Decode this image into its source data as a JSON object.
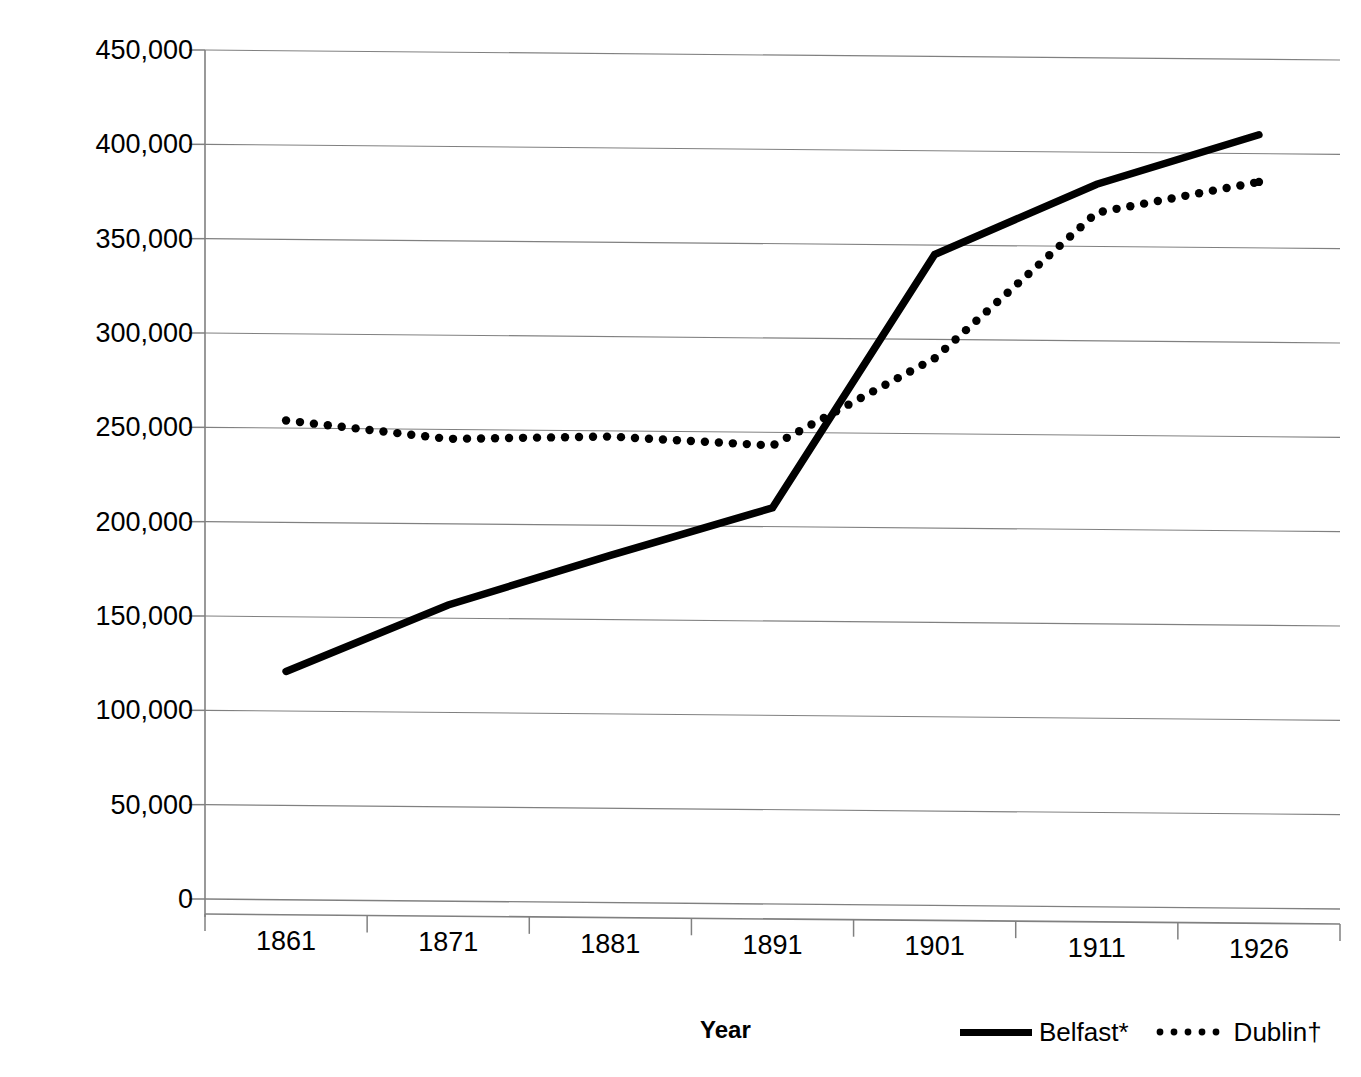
{
  "chart_data": {
    "type": "line",
    "title": "",
    "xlabel": "Year",
    "ylabel": "Population",
    "categories": [
      "1861",
      "1871",
      "1881",
      "1891",
      "1901",
      "1911",
      "1926"
    ],
    "x": [
      1861,
      1871,
      1881,
      1891,
      1901,
      1911,
      1926
    ],
    "series": [
      {
        "name": "Belfast*",
        "style": "solid",
        "color": "#000000",
        "values": [
          121000,
          157000,
          184000,
          210000,
          345000,
          383000,
          410000
        ]
      },
      {
        "name": "Dublin†",
        "style": "dotted",
        "color": "#000000",
        "values": [
          254000,
          245000,
          247000,
          243000,
          290000,
          368000,
          385000
        ]
      }
    ],
    "ylim": [
      0,
      450000
    ],
    "ytick_values": [
      450000,
      400000,
      350000,
      300000,
      250000,
      200000,
      150000,
      100000,
      50000,
      0
    ],
    "ytick_labels": [
      "450,000",
      "400,000",
      "350,000",
      "300,000",
      "250,000",
      "200,000",
      "150,000",
      "100,000",
      "50,000",
      "0"
    ],
    "grid": true,
    "grid_axis": "y",
    "grid_color": "#808080",
    "legend_position": "bottom-right",
    "legend": [
      "Belfast*",
      "Dublin†"
    ]
  },
  "axes": {
    "y_title": "Population",
    "x_title": "Year"
  },
  "legend": {
    "items": [
      {
        "label": "Belfast*",
        "style": "solid"
      },
      {
        "label": "Dublin†",
        "style": "dotted"
      }
    ]
  }
}
